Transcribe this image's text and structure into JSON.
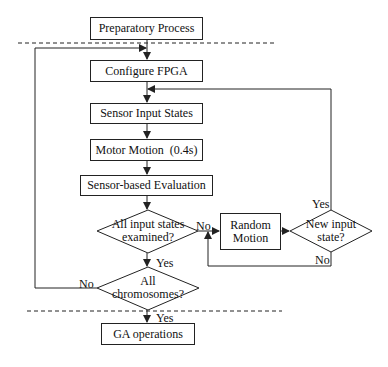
{
  "diagram": {
    "nodes": {
      "preparatory": "Preparatory Process",
      "configure": "Configure FPGA",
      "sensor_input": "Sensor Input States",
      "motor": "Motor Motion  (0.4s)",
      "evaluation": "Sensor-based Evaluation",
      "all_states_l1": "All input states",
      "all_states_l2": "examined?",
      "random_l1": "Random",
      "random_l2": "Motion",
      "new_input_l1": "New input",
      "new_input_l2": "state?",
      "all_chrom_l1": "All",
      "all_chrom_l2": "chromosomes?",
      "ga": "GA operations"
    },
    "edge_labels": {
      "states_no": "No",
      "states_yes": "Yes",
      "new_yes": "Yes",
      "new_no": "No",
      "chrom_no": "No",
      "chrom_yes": "Yes"
    },
    "colors": {
      "line": "#222222",
      "background": "#ffffff"
    }
  }
}
